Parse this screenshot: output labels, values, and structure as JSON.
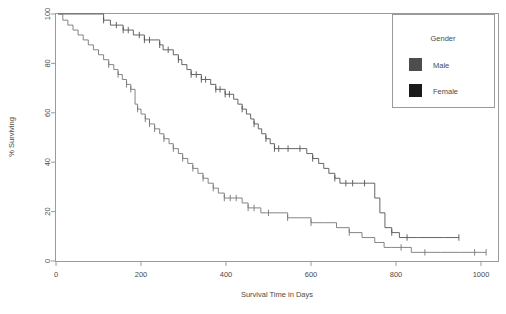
{
  "chart_data": {
    "type": "line",
    "title": "",
    "subtitle": "",
    "xlabel": "Survival Time in Days",
    "ylabel": "% Surviving",
    "xlim": [
      0,
      1040
    ],
    "ylim": [
      0,
      100
    ],
    "xticks": [
      0,
      200,
      400,
      600,
      800,
      1000
    ],
    "xtick_labels": [
      "0",
      "200",
      "400",
      "600",
      "800",
      "1000"
    ],
    "yticks": [
      0,
      20,
      40,
      60,
      80,
      100
    ],
    "ytick_labels": [
      "0",
      "20",
      "40",
      "60",
      "80",
      "100"
    ],
    "grid": false,
    "legend_position": "top-right",
    "legend_title": "Gender",
    "series": [
      {
        "name": "Male",
        "color": "#555555",
        "swatch_color": "#4d4d4d",
        "points": [
          [
            5,
            100
          ],
          [
            18,
            100
          ],
          [
            30,
            100
          ],
          [
            45,
            100
          ],
          [
            60,
            100
          ],
          [
            78,
            100
          ],
          [
            95,
            100
          ],
          [
            112,
            97.5
          ],
          [
            128,
            95.5
          ],
          [
            142,
            95.5
          ],
          [
            158,
            93.5
          ],
          [
            170,
            93.5
          ],
          [
            182,
            91.5
          ],
          [
            196,
            91.5
          ],
          [
            208,
            89.5
          ],
          [
            220,
            89.5
          ],
          [
            232,
            89.5
          ],
          [
            244,
            87.5
          ],
          [
            252,
            85.5
          ],
          [
            264,
            85.5
          ],
          [
            276,
            83.5
          ],
          [
            288,
            81.5
          ],
          [
            296,
            79.5
          ],
          [
            308,
            77.5
          ],
          [
            318,
            75.5
          ],
          [
            330,
            75.5
          ],
          [
            342,
            73.5
          ],
          [
            352,
            73.5
          ],
          [
            364,
            71.5
          ],
          [
            376,
            69.5
          ],
          [
            386,
            69.5
          ],
          [
            398,
            67.5
          ],
          [
            408,
            67.5
          ],
          [
            418,
            65.5
          ],
          [
            428,
            63.5
          ],
          [
            438,
            61.5
          ],
          [
            448,
            59.5
          ],
          [
            458,
            57.5
          ],
          [
            466,
            55.5
          ],
          [
            476,
            53.5
          ],
          [
            484,
            51.5
          ],
          [
            494,
            49.5
          ],
          [
            504,
            47.5
          ],
          [
            514,
            45.5
          ],
          [
            524,
            45.5
          ],
          [
            534,
            45.5
          ],
          [
            546,
            45.5
          ],
          [
            560,
            45.5
          ],
          [
            574,
            45.5
          ],
          [
            590,
            43.5
          ],
          [
            604,
            41.5
          ],
          [
            618,
            39.5
          ],
          [
            630,
            37.5
          ],
          [
            642,
            35.5
          ],
          [
            656,
            33.5
          ],
          [
            668,
            31.5
          ],
          [
            682,
            31.5
          ],
          [
            698,
            31.5
          ],
          [
            712,
            31.5
          ],
          [
            726,
            31.5
          ],
          [
            738,
            31.5
          ],
          [
            750,
            25.5
          ],
          [
            762,
            19.5
          ],
          [
            774,
            13.5
          ],
          [
            790,
            11.5
          ],
          [
            808,
            9.5
          ],
          [
            826,
            9.5
          ],
          [
            850,
            9.5
          ],
          [
            880,
            9.5
          ],
          [
            912,
            9.5
          ],
          [
            948,
            9.5
          ]
        ],
        "censor_times": [
          112,
          142,
          158,
          170,
          196,
          208,
          220,
          244,
          264,
          288,
          318,
          330,
          342,
          352,
          376,
          386,
          398,
          408,
          438,
          466,
          494,
          514,
          524,
          546,
          574,
          604,
          656,
          682,
          698,
          726,
          790,
          826,
          948
        ]
      },
      {
        "name": "Female",
        "color": "#777777",
        "swatch_color": "#1a1a1a",
        "points": [
          [
            5,
            100
          ],
          [
            16,
            97.5
          ],
          [
            28,
            95.5
          ],
          [
            40,
            93.5
          ],
          [
            52,
            91.5
          ],
          [
            64,
            89.5
          ],
          [
            76,
            87.5
          ],
          [
            88,
            85.5
          ],
          [
            100,
            83.5
          ],
          [
            112,
            81.5
          ],
          [
            124,
            79.5
          ],
          [
            136,
            77.5
          ],
          [
            146,
            75.5
          ],
          [
            156,
            73.5
          ],
          [
            166,
            71.5
          ],
          [
            176,
            69.5
          ],
          [
            186,
            63.5
          ],
          [
            192,
            61.5
          ],
          [
            200,
            59.5
          ],
          [
            210,
            57.5
          ],
          [
            220,
            55.5
          ],
          [
            232,
            53.5
          ],
          [
            244,
            51.5
          ],
          [
            254,
            49.5
          ],
          [
            266,
            47.5
          ],
          [
            276,
            45.5
          ],
          [
            288,
            43.5
          ],
          [
            298,
            41.5
          ],
          [
            310,
            39.5
          ],
          [
            322,
            37.5
          ],
          [
            334,
            35.5
          ],
          [
            346,
            33.5
          ],
          [
            358,
            31.5
          ],
          [
            370,
            29.5
          ],
          [
            382,
            27.5
          ],
          [
            396,
            25.5
          ],
          [
            410,
            25.5
          ],
          [
            424,
            25.5
          ],
          [
            438,
            23.5
          ],
          [
            452,
            21.5
          ],
          [
            466,
            21.5
          ],
          [
            482,
            19.5
          ],
          [
            500,
            19.5
          ],
          [
            520,
            19.5
          ],
          [
            545,
            17.5
          ],
          [
            570,
            17.5
          ],
          [
            600,
            15.5
          ],
          [
            630,
            15.5
          ],
          [
            660,
            13.5
          ],
          [
            690,
            11.5
          ],
          [
            720,
            9.5
          ],
          [
            750,
            7.5
          ],
          [
            772,
            5.5
          ],
          [
            790,
            5.5
          ],
          [
            812,
            5.5
          ],
          [
            836,
            3.5
          ],
          [
            868,
            3.5
          ],
          [
            905,
            3.5
          ],
          [
            950,
            3.5
          ],
          [
            985,
            3.5
          ],
          [
            1012,
            3.5
          ]
        ],
        "censor_times": [
          124,
          146,
          166,
          176,
          192,
          210,
          220,
          232,
          254,
          276,
          298,
          322,
          346,
          370,
          396,
          410,
          424,
          452,
          466,
          500,
          545,
          600,
          690,
          812,
          868,
          985,
          1012
        ]
      }
    ]
  },
  "legend": {
    "title": "Gender",
    "entries": [
      {
        "label": "Male",
        "color": "#4d4d4d"
      },
      {
        "label": "Female",
        "color": "#1a1a1a"
      }
    ]
  },
  "axes": {
    "x_title": "Survival Time in Days",
    "y_title": "% Surviving",
    "x_tick_labels": [
      "0",
      "200",
      "400",
      "600",
      "800",
      "1000"
    ],
    "y_tick_labels": [
      "0",
      "20",
      "40",
      "60",
      "80",
      "100"
    ]
  }
}
